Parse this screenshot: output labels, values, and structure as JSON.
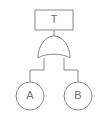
{
  "diagram": {
    "kind": "fault-tree",
    "background_color": "#ffffff",
    "stroke_color": "#8a8a8a",
    "label_color": "#6f6f6f",
    "top_event": {
      "label": "T",
      "shape": "rectangle",
      "x": 35,
      "y": 10,
      "width": 38,
      "height": 20
    },
    "gate": {
      "label": "",
      "type": "OR",
      "shape": "or-gate",
      "x": 38,
      "y": 40,
      "width": 32,
      "height": 22
    },
    "basic_events": [
      {
        "label": "A",
        "shape": "circle",
        "cx": 30,
        "cy": 96,
        "r": 14
      },
      {
        "label": "B",
        "shape": "circle",
        "cx": 78,
        "cy": 96,
        "r": 14
      }
    ],
    "connectors": [
      {
        "name": "top-event-to-gate",
        "path": "M 54 30 L 54 40"
      },
      {
        "name": "gate-to-basic-event-a",
        "path": "M 44 58 L 44 70 L 30 70 L 30 82"
      },
      {
        "name": "gate-to-basic-event-b",
        "path": "M 64 58 L 64 70 L 78 70 L 78 82"
      }
    ]
  }
}
